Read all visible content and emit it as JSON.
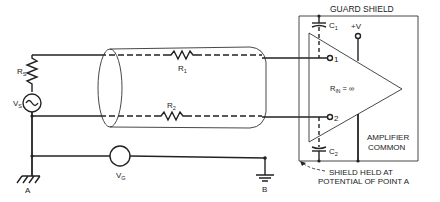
{
  "diagram": {
    "type": "guarded amplifier input circuit",
    "labels": {
      "guard_shield": "GUARD SHIELD",
      "c1": "C",
      "c1_sub": "1",
      "c2": "C",
      "c2_sub": "2",
      "plus_v": "+V",
      "input1": "1",
      "input2": "2",
      "rin": "R",
      "rin_sub": "IN",
      "rin_value": " = ∞",
      "amp_common_1": "AMPLIFIER",
      "amp_common_2": "COMMON",
      "shield_note_1": "SHIELD HELD AT",
      "shield_note_2": "POTENTIAL OF POINT A",
      "rs": "R",
      "rs_sub": "S",
      "vs": "V",
      "vs_sub": "S",
      "r1": "R",
      "r1_sub": "1",
      "r2": "R",
      "r2_sub": "2",
      "vg": "V",
      "vg_sub": "G",
      "point_a": "A",
      "point_b": "B"
    },
    "components": [
      {
        "id": "Rs",
        "kind": "resistor"
      },
      {
        "id": "Vs",
        "kind": "ac-source"
      },
      {
        "id": "R1",
        "kind": "resistor"
      },
      {
        "id": "R2",
        "kind": "resistor"
      },
      {
        "id": "Vg",
        "kind": "voltage-source"
      },
      {
        "id": "C1",
        "kind": "capacitor"
      },
      {
        "id": "C2",
        "kind": "capacitor"
      },
      {
        "id": "amp",
        "kind": "amplifier"
      },
      {
        "id": "shielded-cable",
        "kind": "cable"
      },
      {
        "id": "guard-shield",
        "kind": "shield-enclosure"
      }
    ]
  }
}
